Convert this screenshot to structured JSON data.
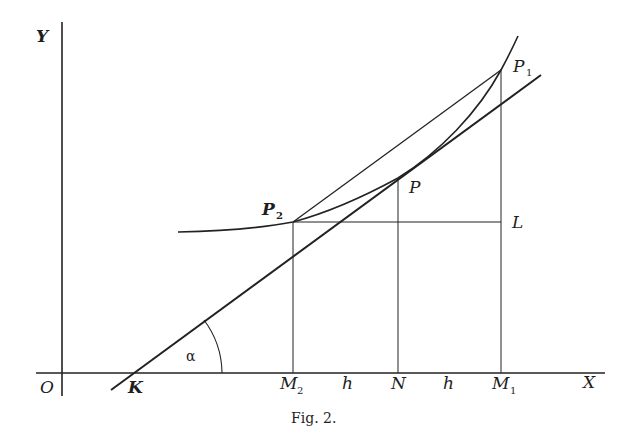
{
  "figure": {
    "caption": "Fig. 2.",
    "axes": {
      "x_label": "X",
      "y_label": "Y",
      "origin_label": "O"
    },
    "points": {
      "K": "K",
      "P": "P",
      "P1": "P",
      "P1_sub": "1",
      "P2": "P",
      "P2_sub": "2",
      "L": "L",
      "N": "N",
      "M1": "M",
      "M1_sub": "1",
      "M2": "M",
      "M2_sub": "2"
    },
    "segments": {
      "h_left": "h",
      "h_right": "h"
    },
    "angle": {
      "label": "α"
    }
  }
}
